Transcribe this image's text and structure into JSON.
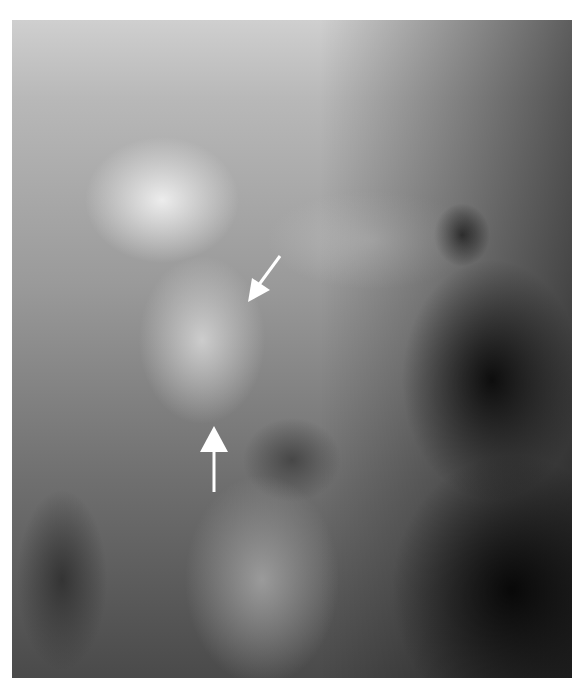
{
  "image": {
    "type": "radiograph",
    "description": "Lateral X-ray of upper cervical spine / skull base with two white arrows indicating a region of interest",
    "colors": {
      "background": "#ffffff",
      "arrow": "#ffffff"
    }
  },
  "annotations": [
    {
      "name": "arrow-down-left",
      "direction": "down-left",
      "tip": [
        248,
        300
      ]
    },
    {
      "name": "arrow-up",
      "direction": "up",
      "tip": [
        213,
        428
      ]
    }
  ]
}
